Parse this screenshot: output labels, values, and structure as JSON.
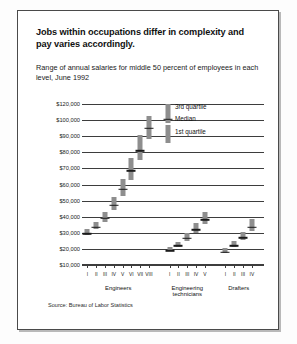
{
  "panel": {
    "title": "Jobs within occupations differ in complexity and pay varies accordingly.",
    "subtitle": "Range of annual salaries for middle 50 percent of employees in each level, June 1992",
    "source": "Source: Bureau of Labor Statistics"
  },
  "legend": {
    "third_quartile": "3rd quartile",
    "median": "Median",
    "first_quartile": "1st quartile"
  },
  "chart_data": {
    "type": "bar",
    "title": "Jobs within occupations differ in complexity and pay varies accordingly.",
    "subtitle": "Range of annual salaries for middle 50 percent of employees in each level, June 1992",
    "xlabel": "",
    "ylabel": "",
    "ylim": [
      10000,
      120000
    ],
    "grid": true,
    "legend_position": "inside-top-center",
    "ytick_labels": [
      "$120,000",
      "$100,000",
      "$90,000",
      "$80,000",
      "$70,000",
      "$60,000",
      "$50,000",
      "$40,000",
      "$30,000",
      "$20,000",
      "$10,000"
    ],
    "ytick_values": [
      120000,
      100000,
      90000,
      80000,
      70000,
      60000,
      50000,
      40000,
      30000,
      20000,
      10000
    ],
    "series": [
      {
        "name": "1st quartile"
      },
      {
        "name": "Median"
      },
      {
        "name": "3rd quartile"
      }
    ],
    "groups": [
      {
        "name": "Engineers",
        "levels": [
          "I",
          "II",
          "III",
          "IV",
          "V",
          "VI",
          "VII",
          "VIII"
        ],
        "points": [
          {
            "level": "I",
            "q1": 28500,
            "median": 30500,
            "q3": 32500
          },
          {
            "level": "II",
            "q1": 32500,
            "median": 34500,
            "q3": 36500
          },
          {
            "level": "III",
            "q1": 37000,
            "median": 40000,
            "q3": 43000
          },
          {
            "level": "IV",
            "q1": 44000,
            "median": 48000,
            "q3": 52500
          },
          {
            "level": "V",
            "q1": 53000,
            "median": 58000,
            "q3": 63500
          },
          {
            "level": "VI",
            "q1": 63000,
            "median": 69500,
            "q3": 76500
          },
          {
            "level": "VII",
            "q1": 75000,
            "median": 82000,
            "q3": 91000
          },
          {
            "level": "VIII",
            "q1": 88000,
            "median": 96000,
            "q3": 105000
          }
        ]
      },
      {
        "name": "Engineering technicians",
        "levels": [
          "I",
          "II",
          "III",
          "IV",
          "V"
        ],
        "points": [
          {
            "level": "I",
            "q1": 18500,
            "median": 19800,
            "q3": 21200
          },
          {
            "level": "II",
            "q1": 21000,
            "median": 22800,
            "q3": 24500
          },
          {
            "level": "III",
            "q1": 25000,
            "median": 27500,
            "q3": 30000
          },
          {
            "level": "IV",
            "q1": 30000,
            "median": 33000,
            "q3": 36000
          },
          {
            "level": "V",
            "q1": 35500,
            "median": 39000,
            "q3": 43000
          }
        ]
      },
      {
        "name": "Drafters",
        "levels": [
          "I",
          "II",
          "III",
          "IV"
        ],
        "points": [
          {
            "level": "I",
            "q1": 17500,
            "median": 19000,
            "q3": 20500
          },
          {
            "level": "II",
            "q1": 21000,
            "median": 23000,
            "q3": 25000
          },
          {
            "level": "III",
            "q1": 25500,
            "median": 28000,
            "q3": 30500
          },
          {
            "level": "IV",
            "q1": 31000,
            "median": 34500,
            "q3": 38500
          }
        ]
      }
    ]
  },
  "colors": {
    "box": "#8e8e8e",
    "median": "#1b1b1b",
    "axis": "#3d3d3d",
    "panel_border": "#4a4a4a"
  }
}
